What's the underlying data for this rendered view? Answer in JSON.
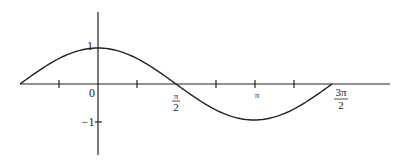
{
  "chart_data": {
    "type": "line",
    "title": "",
    "xlabel": "",
    "ylabel": "",
    "function": "y = cos(x)",
    "xlim": [
      -1.5708,
      3.5
    ],
    "ylim": [
      -1.4,
      1.6
    ],
    "grid": false,
    "legend": null,
    "x_ticks": [
      {
        "value": -1.5708,
        "label": ""
      },
      {
        "value": -0.7854,
        "label": ""
      },
      {
        "value": 0,
        "label": "0"
      },
      {
        "value": 0.7854,
        "label": ""
      },
      {
        "value": 1.5708,
        "label": "π/2"
      },
      {
        "value": 2.3562,
        "label": ""
      },
      {
        "value": 3.1416,
        "label": "π"
      },
      {
        "value": 3.927,
        "label": ""
      },
      {
        "value": 4.7124,
        "label": "3π/2"
      }
    ],
    "y_ticks": [
      {
        "value": 1,
        "label": "1"
      },
      {
        "value": -1,
        "label": "-1"
      }
    ],
    "series": [
      {
        "name": "cos(x)",
        "x": [
          -1.5708,
          -0.7854,
          0,
          0.7854,
          1.5708,
          2.3562,
          3.1416,
          3.927,
          4.7124
        ],
        "y": [
          0,
          0.707,
          1,
          0.707,
          0,
          -0.707,
          -1,
          -0.707,
          0
        ]
      }
    ]
  },
  "labels": {
    "origin": "0",
    "y_one": "1",
    "y_neg_one": "−1",
    "half_pi_num": "π",
    "half_pi_den": "2",
    "pi": "π",
    "three_half_pi_num": "3π",
    "three_half_pi_den": "2"
  }
}
